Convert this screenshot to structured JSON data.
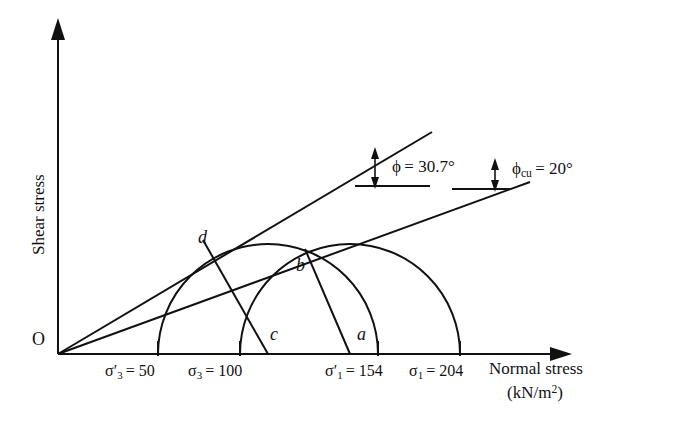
{
  "figure": {
    "type": "mohr-circle-diagram",
    "axes": {
      "y_label": "Shear stress",
      "x_label_line1": "Normal stress",
      "x_label_line2_prefix": "(kN/m",
      "x_label_line2_exp": "2",
      "x_label_line2_suffix": ")",
      "origin_label": "O"
    },
    "ticks": [
      {
        "id": "sigma3-eff",
        "sym": "σ",
        "sub": "3",
        "prime": true,
        "eq": "= 50",
        "value": 50,
        "x": 158
      },
      {
        "id": "sigma3",
        "sym": "σ",
        "sub": "3",
        "prime": false,
        "eq": "= 100",
        "value": 100,
        "x": 240
      },
      {
        "id": "sigma1-eff",
        "sym": "σ",
        "sub": "1",
        "prime": true,
        "eq": "= 154",
        "value": 154,
        "x": 378
      },
      {
        "id": "sigma1",
        "sym": "σ",
        "sub": "1",
        "prime": false,
        "eq": "= 204",
        "value": 204,
        "x": 460
      }
    ],
    "angles": [
      {
        "id": "phi-eff",
        "sym": "ϕ",
        "sub": "",
        "eq": "= 30.7°",
        "value": 30.7
      },
      {
        "id": "phi-cu",
        "sym": "ϕ",
        "sub": "cu",
        "eq": "= 20°",
        "value": 20
      }
    ],
    "points": [
      {
        "id": "point-d",
        "label": "d",
        "x": 203,
        "y": 239
      },
      {
        "id": "point-b",
        "label": "b",
        "x": 300,
        "y": 265
      },
      {
        "id": "point-c",
        "label": "c",
        "x": 272,
        "y": 333
      },
      {
        "id": "point-a",
        "label": "a",
        "x": 360,
        "y": 334
      }
    ],
    "circles": [
      {
        "id": "circle-effective",
        "left": 158,
        "right": 378,
        "center_x": 268,
        "radius": 110
      },
      {
        "id": "circle-total",
        "left": 240,
        "right": 460,
        "center_x": 350,
        "radius": 110
      }
    ],
    "lines": [
      {
        "id": "failure-envelope-effective",
        "angle_deg": 30.7
      },
      {
        "id": "failure-envelope-total",
        "angle_deg": 20
      }
    ],
    "colors": {
      "stroke": "#111111",
      "background": "#ffffff"
    }
  }
}
